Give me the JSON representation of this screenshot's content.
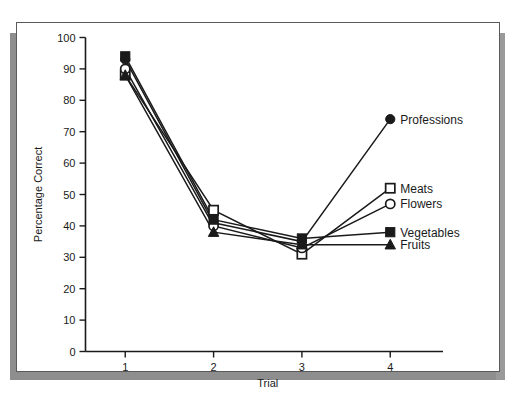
{
  "chart_data": {
    "type": "line",
    "title": "",
    "xlabel": "Trial",
    "ylabel": "Percentage Correct",
    "x": [
      1,
      2,
      3,
      4
    ],
    "xtick_labels": [
      "1",
      "2",
      "3",
      "4"
    ],
    "ytick_labels": [
      "0",
      "10",
      "20",
      "30",
      "40",
      "50",
      "60",
      "70",
      "80",
      "90",
      "100"
    ],
    "ytick_values": [
      0,
      10,
      20,
      30,
      40,
      50,
      60,
      70,
      80,
      90,
      100
    ],
    "xlim": [
      0.55,
      4.45
    ],
    "ylim": [
      0,
      100
    ],
    "grid": false,
    "legend_position": "right-of-last-point",
    "series": [
      {
        "name": "Professions",
        "marker": "filled-circle",
        "values": [
          93,
          41,
          35,
          74
        ]
      },
      {
        "name": "Meats",
        "marker": "open-square",
        "values": [
          88,
          45,
          31,
          52
        ]
      },
      {
        "name": "Flowers",
        "marker": "open-circle",
        "values": [
          90,
          40,
          33,
          47
        ]
      },
      {
        "name": "Vegetables",
        "marker": "filled-square",
        "values": [
          94,
          42,
          36,
          38
        ]
      },
      {
        "name": "Fruits",
        "marker": "filled-triangle",
        "values": [
          88,
          38,
          34,
          34
        ]
      }
    ],
    "colors": {
      "line": "#1a1a1a",
      "marker_fill": "#1a1a1a",
      "marker_open_fill": "#ffffff",
      "axis": "#1a1a1a",
      "panel_background": "#ffffff",
      "panel_border": "#5a5a5a",
      "shadow": "#8e8e8e"
    }
  },
  "axes": {
    "y_title": "Percentage Correct",
    "x_title": "Trial",
    "y_ticks": [
      "100",
      "90",
      "80",
      "70",
      "60",
      "50",
      "40",
      "30",
      "20",
      "10",
      "0"
    ],
    "x_ticks": [
      "1",
      "2",
      "3",
      "4"
    ]
  },
  "legend": {
    "items": [
      {
        "label": "Professions",
        "marker": "filled-circle"
      },
      {
        "label": "Meats",
        "marker": "open-square"
      },
      {
        "label": "Flowers",
        "marker": "open-circle"
      },
      {
        "label": "Vegetables",
        "marker": "filled-square"
      },
      {
        "label": "Fruits",
        "marker": "filled-triangle"
      }
    ]
  }
}
